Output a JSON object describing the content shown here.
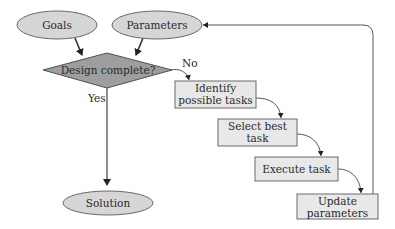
{
  "diagram": {
    "nodes": {
      "goals": {
        "label": "Goals",
        "shape": "ellipse"
      },
      "parameters": {
        "label": "Parameters",
        "shape": "ellipse"
      },
      "design_complete": {
        "label": "Design complete?",
        "shape": "diamond"
      },
      "identify": {
        "label_line1": "Identify",
        "label_line2": "possible tasks",
        "shape": "box"
      },
      "select": {
        "label_line1": "Select best",
        "label_line2": "task",
        "shape": "box"
      },
      "execute": {
        "label": "Execute task",
        "shape": "box"
      },
      "update": {
        "label_line1": "Update",
        "label_line2": "parameters",
        "shape": "box"
      },
      "solution": {
        "label": "Solution",
        "shape": "ellipse"
      }
    },
    "edge_labels": {
      "no": "No",
      "yes": "Yes"
    },
    "edges": [
      {
        "from": "goals",
        "to": "design_complete"
      },
      {
        "from": "parameters",
        "to": "design_complete"
      },
      {
        "from": "design_complete",
        "to": "identify",
        "label": "No"
      },
      {
        "from": "design_complete",
        "to": "solution",
        "label": "Yes"
      },
      {
        "from": "identify",
        "to": "select"
      },
      {
        "from": "select",
        "to": "execute"
      },
      {
        "from": "execute",
        "to": "update"
      },
      {
        "from": "update",
        "to": "parameters"
      }
    ],
    "colors": {
      "ellipse_fill": "#d6d6d6",
      "diamond_fill": "#9e9e9e",
      "box_fill": "#e8e8e8",
      "stroke": "#555555"
    }
  }
}
